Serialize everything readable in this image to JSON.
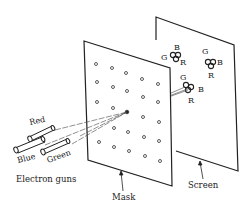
{
  "figure": {
    "labels": {
      "electron_guns": "Electron guns",
      "mask": "Mask",
      "screen": "Screen",
      "gun_red": "Red",
      "gun_blue": "Blue",
      "gun_green": "Green"
    },
    "triads": [
      {
        "g": "G",
        "b": "B",
        "r": "R"
      },
      {
        "g": "G",
        "b": "B",
        "r": "R"
      },
      {
        "g": "G",
        "b": "B",
        "r": "R"
      }
    ],
    "colors": {
      "line": "#222222",
      "background": "#ffffff"
    }
  }
}
